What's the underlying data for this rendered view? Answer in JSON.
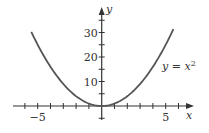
{
  "chart_data": {
    "type": "line",
    "title": "",
    "xlabel": "x",
    "ylabel": "y",
    "xlim": [
      -6.2,
      7
    ],
    "ylim": [
      -5,
      40
    ],
    "grid": false,
    "x_ticks": [
      -6,
      -5,
      -4,
      -3,
      -2,
      -1,
      1,
      2,
      3,
      4,
      5,
      6
    ],
    "x_tick_labels": [
      {
        "value": -5,
        "label": "−5"
      },
      {
        "value": 5,
        "label": "5"
      }
    ],
    "y_ticks": [
      -5,
      5,
      10,
      15,
      20,
      25,
      30,
      35
    ],
    "y_tick_labels": [
      {
        "value": 10,
        "label": "10"
      },
      {
        "value": 20,
        "label": "20"
      },
      {
        "value": 30,
        "label": "30"
      }
    ],
    "series": [
      {
        "name": "y = x^2",
        "function": "x^2",
        "x_range": [
          -5.5,
          5.6
        ],
        "x": [
          -5.5,
          -5,
          -4,
          -3,
          -2,
          -1,
          0,
          1,
          2,
          3,
          4,
          5,
          5.6
        ],
        "y": [
          30.25,
          25,
          16,
          9,
          4,
          1,
          0,
          1,
          4,
          9,
          16,
          25,
          31.36
        ]
      }
    ],
    "annotations": [
      {
        "text_prefix": "y = x",
        "superscript": "2",
        "near_x": 5,
        "near_y": 20
      }
    ],
    "colors": {
      "curve": "#555555",
      "axis": "#333333"
    }
  }
}
